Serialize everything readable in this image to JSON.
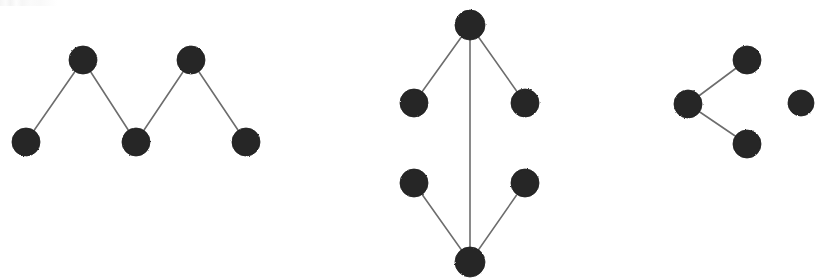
{
  "figure": {
    "width": 832,
    "height": 278,
    "background_color": "#ffffff",
    "node_color": "#262626",
    "node_stroke_color": "#1c1c1c",
    "edge_color": "#6d6d6d",
    "edge_width": 1.6,
    "node_radius": 14
  },
  "chart_data": {
    "type": "diagram",
    "xlabel": "",
    "ylabel": "",
    "grid": false,
    "legend": "none",
    "xlim": [
      0,
      832
    ],
    "ylim": [
      0,
      278
    ],
    "components": [
      {
        "id": "component-left",
        "name": "zigzag-path-5",
        "node_count": 5,
        "edge_count": 4,
        "shape": "zigzag path (W shape)",
        "nodes": [
          {
            "id": "L1",
            "x": 26,
            "y": 142,
            "r": 14,
            "degree": 1
          },
          {
            "id": "L2",
            "x": 83,
            "y": 60,
            "r": 14,
            "degree": 2
          },
          {
            "id": "L3",
            "x": 136,
            "y": 142,
            "r": 14,
            "degree": 2
          },
          {
            "id": "L4",
            "x": 191,
            "y": 60,
            "r": 14,
            "degree": 2
          },
          {
            "id": "L5",
            "x": 246,
            "y": 142,
            "r": 14,
            "degree": 1
          }
        ],
        "edges": [
          {
            "from": "L1",
            "to": "L2"
          },
          {
            "from": "L2",
            "to": "L3"
          },
          {
            "from": "L3",
            "to": "L4"
          },
          {
            "from": "L4",
            "to": "L5"
          }
        ]
      },
      {
        "id": "component-middle",
        "name": "theta-lattice-6",
        "node_count": 6,
        "edge_count": 5,
        "shape": "diamond with long central vertical edge",
        "nodes": [
          {
            "id": "M-top",
            "x": 470,
            "y": 25,
            "r": 15,
            "degree": 3
          },
          {
            "id": "M-upper-left",
            "x": 414,
            "y": 103,
            "r": 14,
            "degree": 1
          },
          {
            "id": "M-upper-right",
            "x": 525,
            "y": 103,
            "r": 14,
            "degree": 1
          },
          {
            "id": "M-lower-left",
            "x": 414,
            "y": 183,
            "r": 14,
            "degree": 1
          },
          {
            "id": "M-lower-right",
            "x": 525,
            "y": 183,
            "r": 14,
            "degree": 1
          },
          {
            "id": "M-bottom",
            "x": 470,
            "y": 262,
            "r": 15,
            "degree": 3
          }
        ],
        "edges": [
          {
            "from": "M-top",
            "to": "M-upper-left"
          },
          {
            "from": "M-top",
            "to": "M-upper-right"
          },
          {
            "from": "M-top",
            "to": "M-bottom"
          },
          {
            "from": "M-lower-left",
            "to": "M-bottom"
          },
          {
            "from": "M-lower-right",
            "to": "M-bottom"
          }
        ]
      },
      {
        "id": "component-right",
        "name": "star-3-plus-isolate",
        "node_count": 4,
        "edge_count": 2,
        "shape": "small star with one isolated node",
        "nodes": [
          {
            "id": "R-hub",
            "x": 688,
            "y": 104,
            "r": 14,
            "degree": 2
          },
          {
            "id": "R-upper",
            "x": 747,
            "y": 60,
            "r": 14,
            "degree": 1
          },
          {
            "id": "R-lower",
            "x": 747,
            "y": 144,
            "r": 14,
            "degree": 1
          },
          {
            "id": "R-isolated",
            "x": 801,
            "y": 103,
            "r": 13,
            "degree": 0
          }
        ],
        "edges": [
          {
            "from": "R-hub",
            "to": "R-upper"
          },
          {
            "from": "R-hub",
            "to": "R-lower"
          }
        ]
      }
    ],
    "totals": {
      "nodes": 15,
      "edges": 11,
      "components": 3
    }
  }
}
